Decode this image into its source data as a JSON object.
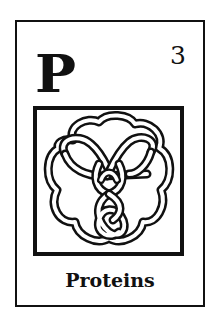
{
  "card": {
    "symbol": "P",
    "number": "3",
    "caption": "Proteins",
    "illustration": "celtic-trefoil-knot-icon",
    "colors": {
      "ink": "#111111",
      "paper": "#ffffff"
    }
  }
}
